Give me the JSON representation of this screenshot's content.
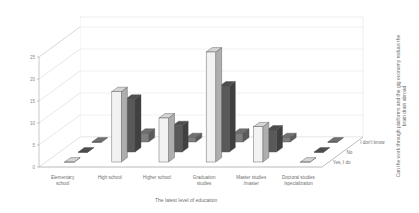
{
  "chart_data": {
    "type": "bar",
    "title": "",
    "subtitle": "",
    "xlabel": "The latest level of education",
    "ylabel": "",
    "zlabel": "Can the work through platforms and the gig economy reduce the brain drain abroad",
    "ylim": [
      0,
      25
    ],
    "yticks": [
      0,
      5,
      10,
      15,
      20,
      25
    ],
    "grid": true,
    "legend_position": "depth-axis-right",
    "three_d": true,
    "categories": [
      "Elementary school",
      "High school",
      "Higher school",
      "Graduation studies",
      "Master studies /master",
      "Doctoral studies /specialization"
    ],
    "series": [
      {
        "name": "I don't know",
        "values": [
          0,
          2,
          1,
          2,
          1,
          0
        ]
      },
      {
        "name": "No",
        "values": [
          0,
          12,
          6,
          15,
          5,
          0
        ]
      },
      {
        "name": "Yes, I do",
        "values": [
          0,
          16,
          10,
          25,
          8,
          0
        ]
      }
    ],
    "zticks": [
      "I don't know",
      "No",
      "Yes, I do"
    ],
    "colors": {
      "series_i_dont_know": "#7f7f7f",
      "series_no": "#595959",
      "series_yes_i_do": "#f2f2f2",
      "grid": "#e3e3e3",
      "axis": "#9a9a9a",
      "text": "#6f6f6f"
    }
  },
  "axes": {
    "y_tick_labels": [
      "0",
      "5",
      "10",
      "15",
      "20",
      "25"
    ],
    "x_title": "The latest level of education",
    "z_title": "Can the work through platforms and the gig economy reduce the brain drain abroad",
    "category_labels": [
      {
        "line1": "Elementary",
        "line2": "school"
      },
      {
        "line1": "High school",
        "line2": ""
      },
      {
        "line1": "Higher school",
        "line2": ""
      },
      {
        "line1": "Graduation",
        "line2": "studies"
      },
      {
        "line1": "Master studies",
        "line2": "/master"
      },
      {
        "line1": "Doctoral studies",
        "line2": "/specialization"
      }
    ],
    "z_tick_labels": [
      "I don't know",
      "No",
      "Yes, I do"
    ]
  }
}
